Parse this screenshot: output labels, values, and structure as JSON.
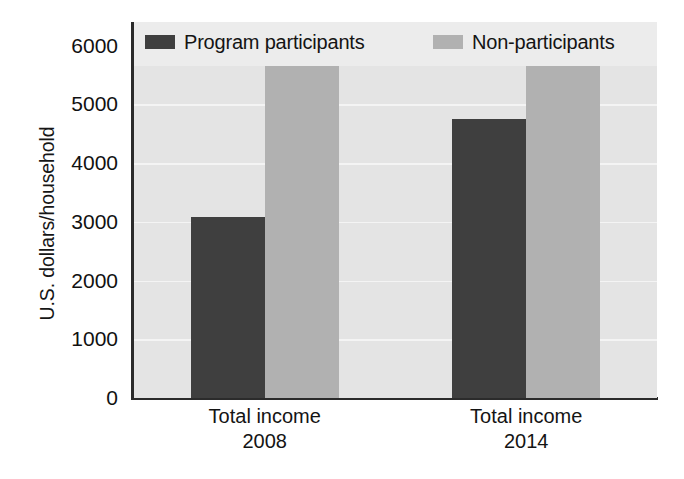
{
  "chart_data": {
    "type": "bar",
    "title": "",
    "xlabel": "",
    "ylabel": "U.S. dollars/household",
    "ylim": [
      0,
      6400
    ],
    "yticks": [
      0,
      1000,
      2000,
      3000,
      4000,
      5000,
      6000
    ],
    "ytick_labels": [
      "0",
      "1000",
      "2000",
      "3000",
      "4000",
      "5000",
      "6000"
    ],
    "grid": true,
    "legend_position": "top",
    "categories": [
      "Total income 2008",
      "Total income 2014"
    ],
    "category_lines": [
      {
        "line1": "Total income",
        "line2": "2008"
      },
      {
        "line1": "Total income",
        "line2": "2014"
      }
    ],
    "series": [
      {
        "name": "Program participants",
        "color": "#3f3f3f",
        "values": [
          3080,
          4750
        ]
      },
      {
        "name": "Non-participants",
        "color": "#b1b1b1",
        "values": [
          5650,
          5700
        ]
      }
    ]
  },
  "legend": {
    "items": [
      {
        "label": "Program participants",
        "swatch": "dark-swatch-icon"
      },
      {
        "label": "Non-participants",
        "swatch": "light-swatch-icon"
      }
    ]
  },
  "colors": {
    "series_dark": "#3f3f3f",
    "series_light": "#b1b1b1",
    "plot_background": "#e4e4e4",
    "gridline": "#f4f4f4",
    "axis": "#2b2b2b",
    "text": "#141414",
    "page_background": "#ffffff"
  }
}
